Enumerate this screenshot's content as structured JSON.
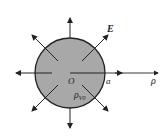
{
  "diagram": {
    "labels": {
      "field": "E",
      "origin": "O",
      "radius": "a",
      "axis": "ρ",
      "charge_main": "ρ",
      "charge_sub": "V0"
    },
    "colors": {
      "sphere_fill": "#a8a8a8",
      "stroke": "#222222"
    }
  }
}
